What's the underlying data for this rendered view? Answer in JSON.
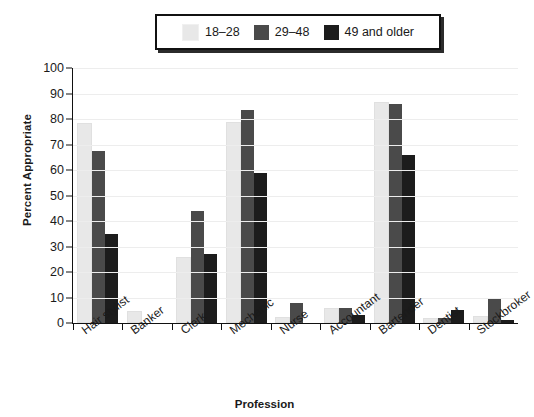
{
  "chart_data": {
    "type": "bar",
    "title": "",
    "xlabel": "Profession",
    "ylabel": "Percent Appropriate",
    "ylim": [
      0,
      100
    ],
    "ytick_step": 10,
    "yticks": [
      100,
      90,
      80,
      70,
      60,
      50,
      40,
      30,
      20,
      10,
      0
    ],
    "grid": true,
    "legend_position": "top-center",
    "categories": [
      "Hair stylist",
      "Banker",
      "Clerk",
      "Mechanic",
      "Nurse",
      "Accountant",
      "Bartender",
      "Dentist",
      "Stockbroker"
    ],
    "series": [
      {
        "name": "18–28",
        "color": "#e8e8e8",
        "values": [
          77.5,
          4,
          25,
          78,
          1.5,
          5,
          86,
          1,
          2
        ]
      },
      {
        "name": "29–48",
        "color": "#4a4a4a",
        "values": [
          67.5,
          0,
          44,
          83.5,
          8,
          6,
          86,
          2,
          9.5
        ]
      },
      {
        "name": "49 and older",
        "color": "#1c1c1c",
        "values": [
          35,
          0,
          27,
          59,
          0,
          3,
          66,
          5,
          1
        ]
      }
    ]
  },
  "legend": {
    "items": [
      {
        "label": "18–28",
        "color": "#e8e8e8"
      },
      {
        "label": "29–48",
        "color": "#4a4a4a"
      },
      {
        "label": "49 and older",
        "color": "#1c1c1c"
      }
    ]
  },
  "axes": {
    "y_title": "Percent Appropriate",
    "x_title": "Profession"
  }
}
